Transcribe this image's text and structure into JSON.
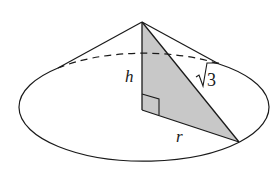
{
  "diagram": {
    "type": "cone-cross-section",
    "labels": {
      "height": "h",
      "slant": "√3",
      "slant_radical": "√",
      "slant_value": "3",
      "radius": "r"
    },
    "elements": [
      "cone apex",
      "elliptical base",
      "hidden back edge (dashed)",
      "shaded right triangle",
      "right-angle marker"
    ],
    "colors": {
      "stroke": "#1a1a1a",
      "shade": "#c8c8c8",
      "background": "#ffffff"
    }
  }
}
